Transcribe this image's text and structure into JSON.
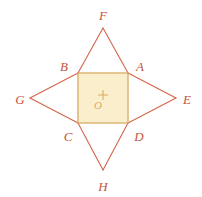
{
  "figure": {
    "canvas": {
      "width": 202,
      "height": 197,
      "background": "#ffffff"
    },
    "colors": {
      "stroke": "#d4654a",
      "label": "#c4543c",
      "square_fill": "#fbeecd",
      "square_stroke": "#dcb878",
      "center_mark": "#d8ab63",
      "center_label": "#d8ab63"
    },
    "stroke_width": 1.1,
    "square": {
      "name": "central-square",
      "fill": "#fbeecd",
      "stroke": "#dcb878",
      "x": 78,
      "y": 73,
      "width": 50,
      "height": 50
    },
    "center": {
      "label": "O",
      "mark": "plus",
      "mark_x": 103,
      "mark_y": 95,
      "mark_size": 9,
      "label_x": 98,
      "label_y": 105
    },
    "points": [
      {
        "id": "A",
        "label": "A",
        "x": 128,
        "y": 73,
        "label_x": 140,
        "label_y": 66,
        "kind": "square-corner"
      },
      {
        "id": "B",
        "label": "B",
        "x": 78,
        "y": 73,
        "label_x": 64,
        "label_y": 66,
        "kind": "square-corner"
      },
      {
        "id": "C",
        "label": "C",
        "x": 78,
        "y": 123,
        "label_x": 68,
        "label_y": 136,
        "kind": "square-corner"
      },
      {
        "id": "D",
        "label": "D",
        "x": 128,
        "y": 123,
        "label_x": 139,
        "label_y": 136,
        "kind": "square-corner"
      },
      {
        "id": "E",
        "label": "E",
        "x": 176,
        "y": 98,
        "label_x": 187,
        "label_y": 99,
        "kind": "star-tip"
      },
      {
        "id": "F",
        "label": "F",
        "x": 103,
        "y": 28,
        "label_x": 103,
        "label_y": 15,
        "kind": "star-tip"
      },
      {
        "id": "G",
        "label": "G",
        "x": 30,
        "y": 98,
        "label_x": 20,
        "label_y": 99,
        "kind": "star-tip"
      },
      {
        "id": "H",
        "label": "H",
        "x": 103,
        "y": 170,
        "label_x": 103,
        "label_y": 186,
        "kind": "star-tip"
      }
    ],
    "edges": [
      {
        "id": "B-F",
        "from": "B",
        "to": "F"
      },
      {
        "id": "F-A",
        "from": "F",
        "to": "A"
      },
      {
        "id": "A-E",
        "from": "A",
        "to": "E"
      },
      {
        "id": "E-D",
        "from": "E",
        "to": "D"
      },
      {
        "id": "D-H",
        "from": "D",
        "to": "H"
      },
      {
        "id": "H-C",
        "from": "H",
        "to": "C"
      },
      {
        "id": "C-G",
        "from": "C",
        "to": "G"
      },
      {
        "id": "G-B",
        "from": "G",
        "to": "B"
      },
      {
        "id": "B-A",
        "from": "B",
        "to": "A"
      },
      {
        "id": "A-D",
        "from": "A",
        "to": "D"
      },
      {
        "id": "D-C",
        "from": "D",
        "to": "C"
      },
      {
        "id": "C-B",
        "from": "C",
        "to": "B"
      }
    ]
  }
}
